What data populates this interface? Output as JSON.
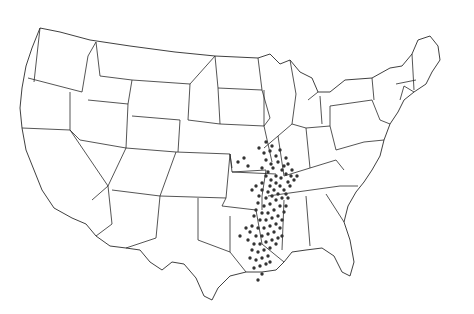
{
  "map": {
    "title": "",
    "region": "Contiguous United States",
    "style": "black outline state boundaries on white, dot distribution",
    "colors": {
      "background": "#ffffff",
      "outline": "#2a2a2a",
      "dots": "#333333"
    },
    "distribution": {
      "description": "Dense cluster of occurrence dots along the Mississippi River valley",
      "states_with_dots": [
        "Illinois",
        "Missouri",
        "Kentucky",
        "Tennessee",
        "Arkansas",
        "Mississippi",
        "Louisiana",
        "Indiana"
      ],
      "points": [
        [
          259,
          148
        ],
        [
          264,
          153
        ],
        [
          270,
          151
        ],
        [
          266,
          160
        ],
        [
          271,
          164
        ],
        [
          276,
          156
        ],
        [
          262,
          168
        ],
        [
          268,
          172
        ],
        [
          273,
          168
        ],
        [
          278,
          162
        ],
        [
          282,
          170
        ],
        [
          276,
          176
        ],
        [
          271,
          180
        ],
        [
          266,
          176
        ],
        [
          262,
          183
        ],
        [
          270,
          186
        ],
        [
          276,
          183
        ],
        [
          281,
          178
        ],
        [
          286,
          174
        ],
        [
          284,
          166
        ],
        [
          280,
          186
        ],
        [
          274,
          190
        ],
        [
          268,
          192
        ],
        [
          262,
          190
        ],
        [
          256,
          186
        ],
        [
          252,
          190
        ],
        [
          259,
          196
        ],
        [
          266,
          198
        ],
        [
          272,
          196
        ],
        [
          278,
          194
        ],
        [
          284,
          190
        ],
        [
          288,
          182
        ],
        [
          291,
          176
        ],
        [
          276,
          200
        ],
        [
          270,
          204
        ],
        [
          264,
          206
        ],
        [
          258,
          203
        ],
        [
          282,
          198
        ],
        [
          286,
          194
        ],
        [
          280,
          206
        ],
        [
          274,
          210
        ],
        [
          268,
          213
        ],
        [
          262,
          213
        ],
        [
          256,
          210
        ],
        [
          272,
          218
        ],
        [
          266,
          220
        ],
        [
          278,
          216
        ],
        [
          284,
          212
        ],
        [
          260,
          220
        ],
        [
          254,
          216
        ],
        [
          270,
          226
        ],
        [
          264,
          228
        ],
        [
          276,
          224
        ],
        [
          282,
          220
        ],
        [
          258,
          228
        ],
        [
          252,
          226
        ],
        [
          268,
          234
        ],
        [
          262,
          236
        ],
        [
          274,
          232
        ],
        [
          280,
          228
        ],
        [
          256,
          236
        ],
        [
          250,
          232
        ],
        [
          266,
          242
        ],
        [
          260,
          244
        ],
        [
          272,
          240
        ],
        [
          278,
          238
        ],
        [
          254,
          244
        ],
        [
          248,
          240
        ],
        [
          264,
          250
        ],
        [
          258,
          252
        ],
        [
          270,
          248
        ],
        [
          252,
          250
        ],
        [
          262,
          258
        ],
        [
          256,
          260
        ],
        [
          268,
          256
        ],
        [
          250,
          258
        ],
        [
          260,
          266
        ],
        [
          254,
          268
        ],
        [
          266,
          264
        ],
        [
          262,
          274
        ],
        [
          244,
          158
        ],
        [
          238,
          162
        ],
        [
          248,
          166
        ],
        [
          290,
          186
        ],
        [
          294,
          180
        ],
        [
          288,
          164
        ],
        [
          292,
          170
        ],
        [
          297,
          176
        ],
        [
          266,
          142
        ],
        [
          272,
          146
        ],
        [
          286,
          158
        ],
        [
          280,
          150
        ],
        [
          246,
          228
        ],
        [
          240,
          236
        ],
        [
          286,
          206
        ],
        [
          288,
          198
        ],
        [
          276,
          244
        ],
        [
          282,
          236
        ],
        [
          270,
          262
        ],
        [
          258,
          280
        ]
      ]
    }
  }
}
